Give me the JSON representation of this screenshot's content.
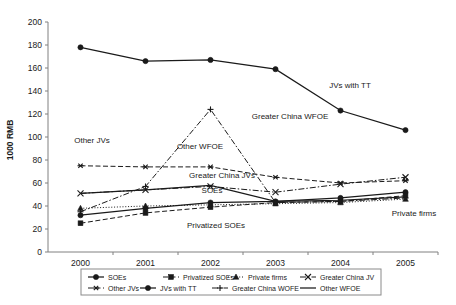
{
  "chart_data": {
    "type": "line",
    "title": "",
    "xlabel": "",
    "ylabel": "1000 RMB",
    "categories": [
      "2000",
      "2001",
      "2002",
      "2003",
      "2004",
      "2005"
    ],
    "x": [
      2000,
      2001,
      2002,
      2003,
      2004,
      2005
    ],
    "ylim": [
      0,
      200
    ],
    "ytick_values": [
      0,
      20,
      40,
      60,
      80,
      100,
      120,
      140,
      160,
      180,
      200
    ],
    "ytick_labels": [
      "0",
      "20",
      "40",
      "60",
      "80",
      "100",
      "120",
      "140",
      "160",
      "180",
      "200"
    ],
    "grid": false,
    "legend_position": "bottom",
    "series": [
      {
        "name": "SOEs",
        "values": [
          32,
          38,
          43,
          44,
          47,
          52
        ],
        "marker": "circle",
        "dash": "solid"
      },
      {
        "name": "Privatized SOEs",
        "values": [
          25,
          34,
          39,
          43,
          44,
          49
        ],
        "marker": "square",
        "dash": "dashed"
      },
      {
        "name": "Private firms",
        "values": [
          38,
          40,
          41,
          42,
          43,
          46
        ],
        "marker": "triangle",
        "dash": "dotted"
      },
      {
        "name": "Greater China JV",
        "values": [
          51,
          54,
          57,
          52,
          59,
          65
        ],
        "marker": "cross",
        "dash": "dashdot"
      },
      {
        "name": "Other JVs",
        "values": [
          75,
          74,
          74,
          65,
          60,
          62
        ],
        "marker": "asterisk",
        "dash": "dashed"
      },
      {
        "name": "JVs with TT",
        "values": [
          178,
          166,
          167,
          159,
          123,
          106
        ],
        "marker": "circle",
        "dash": "solid"
      },
      {
        "name": "Greater China WOFE",
        "values": [
          35,
          57,
          124,
          43,
          44,
          47
        ],
        "marker": "plus",
        "dash": "dashdot"
      },
      {
        "name": "Other WFOE",
        "values": [
          51,
          54,
          58,
          44,
          45,
          48
        ],
        "marker": "none",
        "dash": "solid"
      }
    ],
    "annotations": [
      {
        "text": "JVs with TT",
        "x": 350,
        "y": 88,
        "anchor": "middle"
      },
      {
        "text": "Greater China WFOE",
        "x": 290,
        "y": 119,
        "anchor": "middle"
      },
      {
        "text": "Other WFOE",
        "x": 200,
        "y": 149,
        "anchor": "middle"
      },
      {
        "text": "Other JVs",
        "x": 92,
        "y": 143,
        "anchor": "middle"
      },
      {
        "text": "Greater China JVs",
        "x": 222,
        "y": 178,
        "anchor": "middle"
      },
      {
        "text": "SOEs",
        "x": 212,
        "y": 193,
        "anchor": "middle"
      },
      {
        "text": "Privatized SOEs",
        "x": 216,
        "y": 228,
        "anchor": "middle"
      },
      {
        "text": "Private firms",
        "x": 414,
        "y": 216,
        "anchor": "middle"
      }
    ],
    "legend_rows": [
      [
        "SOEs",
        "Privatized SOEs",
        "Private firms",
        "Greater China JV"
      ],
      [
        "Other JVs",
        "JVs with TT",
        "Greater China WOFE",
        "Other WFOE"
      ]
    ]
  },
  "colors": {
    "ink": "#1a1a1a",
    "axis": "#808080",
    "legend_border": "#8a8a8a",
    "background": "#ffffff"
  }
}
